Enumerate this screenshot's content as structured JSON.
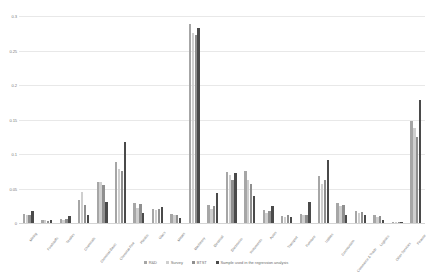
{
  "chart_data": {
    "type": "bar",
    "title": "",
    "subtitle": "",
    "xlabel": "",
    "ylabel": "",
    "ylim": [
      0,
      0.3
    ],
    "ytick_labels": [
      "0.3",
      "0.25",
      "0.2",
      "0.15",
      "0.1",
      "0.05",
      "0"
    ],
    "ytick_values": [
      0.3,
      0.25,
      0.2,
      0.15,
      0.1,
      0.05,
      0
    ],
    "grid": true,
    "legend_position": "bottom",
    "orientation": "vertical",
    "categories": [
      "Mining",
      "Foodstuffs",
      "Textiles",
      "Chemicals",
      "Chemical-Basic",
      "Chemical-Fine",
      "Plastics",
      "Glass",
      "Metals",
      "Machinery",
      "Electrical",
      "Electronics",
      "Instruments",
      "Autos",
      "Transport",
      "Furniture",
      "Utilities",
      "Construction",
      "Commerce & Trade",
      "Logistics",
      "Other Services",
      "Finance"
    ],
    "series": [
      {
        "name": "R&D",
        "color": "#a6a6a6",
        "values": [
          0.013,
          0.004,
          0.006,
          0.033,
          0.06,
          0.088,
          0.029,
          0.02,
          0.013,
          0.288,
          0.026,
          0.074,
          0.076,
          0.019,
          0.01,
          0.013,
          0.068,
          0.029,
          0.017,
          0.011,
          0.002,
          0.148
        ]
      },
      {
        "name": "Survey",
        "color": "#cfcfcf",
        "values": [
          0.011,
          0.004,
          0.005,
          0.045,
          0.059,
          0.079,
          0.022,
          0.019,
          0.011,
          0.275,
          0.021,
          0.069,
          0.062,
          0.015,
          0.009,
          0.011,
          0.056,
          0.024,
          0.015,
          0.009,
          0.002,
          0.138
        ]
      },
      {
        "name": "BTST",
        "color": "#8f8f8f",
        "values": [
          0.012,
          0.003,
          0.006,
          0.026,
          0.055,
          0.075,
          0.028,
          0.021,
          0.012,
          0.272,
          0.024,
          0.062,
          0.056,
          0.017,
          0.011,
          0.012,
          0.062,
          0.026,
          0.016,
          0.01,
          0.002,
          0.125
        ]
      },
      {
        "name": "Sample used in the regression analysis",
        "color": "#4a4a4a",
        "values": [
          0.018,
          0.005,
          0.01,
          0.012,
          0.03,
          0.118,
          0.015,
          0.023,
          0.007,
          0.283,
          0.044,
          0.072,
          0.039,
          0.024,
          0.008,
          0.03,
          0.092,
          0.011,
          0.012,
          0.005,
          0.001,
          0.178
        ]
      }
    ]
  }
}
